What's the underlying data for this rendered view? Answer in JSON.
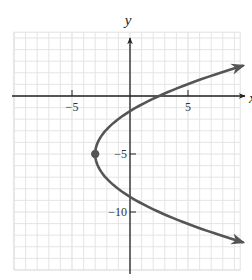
{
  "chart_data": {
    "type": "line",
    "title": "",
    "xlabel": "x",
    "ylabel": "y",
    "xlim": [
      -10,
      9.5
    ],
    "ylim": [
      -15,
      5.5
    ],
    "grid": true,
    "x_ticks": [
      {
        "value": -5,
        "label": "−5"
      },
      {
        "value": 5,
        "label": "5"
      }
    ],
    "y_ticks": [
      {
        "value": -5,
        "label": "−5"
      },
      {
        "value": -10,
        "label": "−10"
      }
    ],
    "series": [
      {
        "name": "parabola",
        "equation": "x = 0.22(y + 5)^2 - 3",
        "orientation": "opens-right",
        "vertex": [
          -3,
          -5
        ],
        "a": 0.22,
        "y_range": [
          -12.6,
          2.6
        ],
        "points": [
          {
            "x": 9.6,
            "y": 2.6
          },
          {
            "x": 3.0,
            "y": 0
          },
          {
            "x": 0,
            "y": -1.3
          },
          {
            "x": -3,
            "y": -5
          },
          {
            "x": 0,
            "y": -8.7
          },
          {
            "x": 9.6,
            "y": -12.6
          }
        ],
        "arrows": "both-ends"
      }
    ],
    "marked_points": [
      {
        "x": -3,
        "y": -5,
        "label": "vertex"
      }
    ]
  },
  "colors": {
    "grid": "#e2e2e2",
    "axis": "#222222",
    "curve": "#555555",
    "vertex": "#555555"
  }
}
